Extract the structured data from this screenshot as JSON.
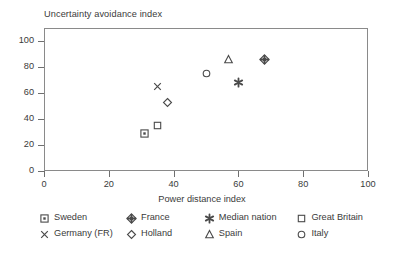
{
  "chart_data": {
    "type": "scatter",
    "title": "",
    "ylabel": "Uncertainty avoidance index",
    "xlabel": "Power distance index",
    "xlim": [
      0,
      100
    ],
    "ylim": [
      0,
      110
    ],
    "xticks": [
      "0",
      "20",
      "40",
      "60",
      "80",
      "100"
    ],
    "yticks": [
      "0",
      "20",
      "40",
      "60",
      "80",
      "100"
    ],
    "grid": false,
    "legend_position": "below",
    "points": [
      {
        "name": "Sweden",
        "marker": "square-dot-marker",
        "x": 31,
        "y": 29
      },
      {
        "name": "Great Britain",
        "marker": "square-marker",
        "x": 35,
        "y": 35
      },
      {
        "name": "Germany (FR)",
        "marker": "cross-marker",
        "x": 35,
        "y": 65
      },
      {
        "name": "Holland",
        "marker": "diamond-marker",
        "x": 38,
        "y": 53
      },
      {
        "name": "Italy",
        "marker": "circle-marker",
        "x": 50,
        "y": 75
      },
      {
        "name": "Spain",
        "marker": "triangle-marker",
        "x": 57,
        "y": 86
      },
      {
        "name": "Median nation",
        "marker": "asterisk-marker",
        "x": 60,
        "y": 68
      },
      {
        "name": "France",
        "marker": "diamond-cross-marker",
        "x": 68,
        "y": 86
      }
    ],
    "legend": [
      [
        {
          "name": "Sweden",
          "marker": "square-dot-marker"
        },
        {
          "name": "France",
          "marker": "diamond-cross-marker"
        },
        {
          "name": "Median nation",
          "marker": "asterisk-marker"
        },
        {
          "name": "Great Britain",
          "marker": "square-marker"
        }
      ],
      [
        {
          "name": "Germany (FR)",
          "marker": "cross-marker"
        },
        {
          "name": "Holland",
          "marker": "diamond-marker"
        },
        {
          "name": "Spain",
          "marker": "triangle-marker"
        },
        {
          "name": "Italy",
          "marker": "circle-marker"
        }
      ]
    ],
    "colors": {
      "marker": "#4a4a4a",
      "axis": "#8a8a8a",
      "text": "#3a3a3a",
      "background": "#ffffff"
    }
  }
}
